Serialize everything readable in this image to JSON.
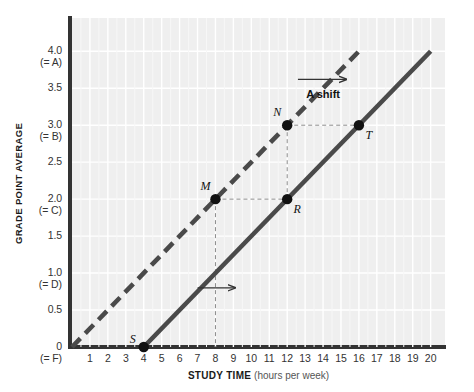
{
  "chart_data": {
    "type": "line",
    "title": "",
    "xlabel_bold": "STUDY TIME",
    "xlabel_light": "(hours per week)",
    "ylabel": "GRADE POINT AVERAGE",
    "xlim": [
      0,
      20.8
    ],
    "ylim": [
      0,
      4.45
    ],
    "grid": true,
    "legend": "none",
    "x_ticks": [
      "1",
      "2",
      "3",
      "4",
      "5",
      "6",
      "7",
      "8",
      "9",
      "10",
      "11",
      "12",
      "13",
      "14",
      "15",
      "16",
      "17",
      "18",
      "19",
      "20"
    ],
    "x_tick_values": [
      1,
      2,
      3,
      4,
      5,
      6,
      7,
      8,
      9,
      10,
      11,
      12,
      13,
      14,
      15,
      16,
      17,
      18,
      19,
      20
    ],
    "y_ticks": [
      {
        "value": 0,
        "main": "0",
        "sub": "(= F)"
      },
      {
        "value": 0.5,
        "main": "0.5",
        "sub": ""
      },
      {
        "value": 1.0,
        "main": "1.0",
        "sub": "(= D)"
      },
      {
        "value": 1.5,
        "main": "1.5",
        "sub": ""
      },
      {
        "value": 2.0,
        "main": "2.0",
        "sub": "(= C)"
      },
      {
        "value": 2.5,
        "main": "2.5",
        "sub": ""
      },
      {
        "value": 3.0,
        "main": "3.0",
        "sub": "(= B)"
      },
      {
        "value": 3.5,
        "main": "3.5",
        "sub": ""
      },
      {
        "value": 4.0,
        "main": "4.0",
        "sub": "(= A)"
      }
    ],
    "series": [
      {
        "name": "original-line",
        "style": "dashed",
        "color": "#4a4a4a",
        "x": [
          0,
          16.2
        ],
        "y": [
          0,
          4.05
        ],
        "slope": 0.25,
        "x_intercept": 0
      },
      {
        "name": "shifted-line",
        "style": "solid",
        "color": "#4a4a4a",
        "x": [
          4,
          20.0
        ],
        "y": [
          0,
          4.0
        ],
        "slope": 0.25,
        "x_intercept": 4
      }
    ],
    "points": [
      {
        "label": "S",
        "x": 4,
        "y": 0.0,
        "label_pos": "left"
      },
      {
        "label": "M",
        "x": 8,
        "y": 2.0,
        "label_pos": "upper-left"
      },
      {
        "label": "N",
        "x": 12,
        "y": 3.0,
        "label_pos": "upper-left"
      },
      {
        "label": "R",
        "x": 12,
        "y": 2.0,
        "label_pos": "lower-right"
      },
      {
        "label": "T",
        "x": 16,
        "y": 3.0,
        "label_pos": "lower-right"
      }
    ],
    "guide_lines": [
      {
        "from": [
          8,
          2.0
        ],
        "to": [
          12,
          2.0
        ],
        "style": "dashed"
      },
      {
        "from": [
          8,
          2.0
        ],
        "to": [
          8,
          0.0
        ],
        "style": "dashed"
      },
      {
        "from": [
          12,
          3.0
        ],
        "to": [
          16,
          3.0
        ],
        "style": "dashed"
      },
      {
        "from": [
          12,
          3.0
        ],
        "to": [
          12,
          2.0
        ],
        "style": "dashed"
      }
    ],
    "annotations": [
      {
        "name": "a-shift-label",
        "text": "A shift",
        "x": 14.0,
        "y": 3.37,
        "arrow": {
          "from": [
            12.6,
            3.62
          ],
          "to": [
            15.3,
            3.62
          ]
        }
      },
      {
        "name": "lower-shift-arrow",
        "text": "",
        "arrow": {
          "from": [
            7.0,
            0.8
          ],
          "to": [
            9.1,
            0.8
          ]
        }
      }
    ],
    "colors": {
      "plot_background": "#efefef",
      "grid_line": "#ffffff",
      "axis": "#333333",
      "line": "#4a4a4a",
      "point": "#111111",
      "guide": "#8c8c8c",
      "text": "#1a1a1a"
    }
  }
}
